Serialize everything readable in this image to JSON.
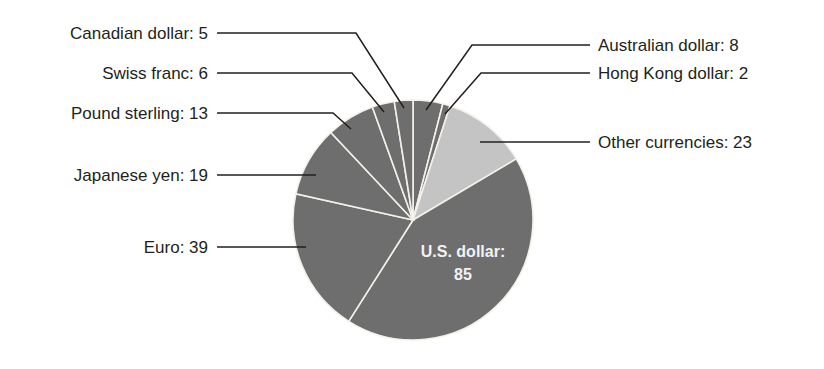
{
  "chart_data": {
    "type": "pie",
    "title": "",
    "total": 200,
    "start_angle_deg": 0,
    "direction": "clockwise",
    "slices": [
      {
        "label": "Australian dollar",
        "value": 8,
        "display": "Australian dollar: 8",
        "color": "#6e6e6e",
        "side": "right"
      },
      {
        "label": "Hong Kong dollar",
        "value": 2,
        "display": "Hong Kong dollar: 2",
        "color": "#6e6e6e",
        "side": "right"
      },
      {
        "label": "Other currencies",
        "value": 23,
        "display": "Other currencies: 23",
        "color": "#c4c4c4",
        "side": "right"
      },
      {
        "label": "U.S. dollar",
        "value": 85,
        "display": "U.S. dollar:",
        "display_value": "85",
        "color": "#6e6e6e",
        "side": "inside"
      },
      {
        "label": "Euro",
        "value": 39,
        "display": "Euro: 39",
        "color": "#6e6e6e",
        "side": "left"
      },
      {
        "label": "Japanese yen",
        "value": 19,
        "display": "Japanese yen: 19",
        "color": "#6e6e6e",
        "side": "left"
      },
      {
        "label": "Pound sterling",
        "value": 13,
        "display": "Pound sterling: 13",
        "color": "#6e6e6e",
        "side": "left"
      },
      {
        "label": "Swiss franc",
        "value": 6,
        "display": "Swiss franc: 6",
        "color": "#6e6e6e",
        "side": "left"
      },
      {
        "label": "Canadian dollar",
        "value": 5,
        "display": "Canadian dollar: 5",
        "color": "#6e6e6e",
        "side": "left"
      }
    ],
    "legend": "none (callout labels with leader lines)"
  },
  "layout": {
    "center": [
      413,
      220
    ],
    "radius": 120,
    "separator_color": "#f4f1ea",
    "text_color": "#231f20",
    "callouts": [
      {
        "slice": "Australian dollar",
        "text_anchor": "start",
        "text_xy": [
          598,
          51
        ],
        "points": [
          [
            426,
            110
          ],
          [
            472,
            45
          ],
          [
            590,
            45
          ]
        ]
      },
      {
        "slice": "Hong Kong dollar",
        "text_anchor": "start",
        "text_xy": [
          598,
          79
        ],
        "points": [
          [
            445,
            114
          ],
          [
            481,
            73
          ],
          [
            590,
            73
          ]
        ]
      },
      {
        "slice": "Other currencies",
        "text_anchor": "start",
        "text_xy": [
          598,
          148
        ],
        "points": [
          [
            480,
            142
          ],
          [
            590,
            142
          ]
        ]
      },
      {
        "slice": "Euro",
        "text_anchor": "end",
        "text_xy": [
          208,
          253
        ],
        "points": [
          [
            217,
            247
          ],
          [
            306,
            247
          ]
        ]
      },
      {
        "slice": "Japanese yen",
        "text_anchor": "end",
        "text_xy": [
          208,
          181
        ],
        "points": [
          [
            217,
            175
          ],
          [
            316,
            175
          ]
        ]
      },
      {
        "slice": "Pound sterling",
        "text_anchor": "end",
        "text_xy": [
          208,
          119
        ],
        "points": [
          [
            217,
            113
          ],
          [
            333,
            113
          ],
          [
            351,
            129
          ]
        ]
      },
      {
        "slice": "Swiss franc",
        "text_anchor": "end",
        "text_xy": [
          208,
          79
        ],
        "points": [
          [
            217,
            73
          ],
          [
            352,
            73
          ],
          [
            384,
            112
          ]
        ]
      },
      {
        "slice": "Canadian dollar",
        "text_anchor": "end",
        "text_xy": [
          208,
          39
        ],
        "points": [
          [
            217,
            33
          ],
          [
            356,
            33
          ],
          [
            404,
            108
          ]
        ]
      }
    ],
    "inside_label": {
      "slice": "U.S. dollar",
      "xy": [
        463,
        257
      ],
      "value_xy": [
        463,
        280
      ]
    }
  }
}
